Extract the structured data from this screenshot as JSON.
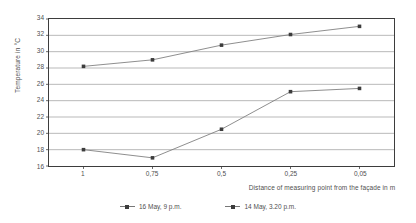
{
  "chart_data": {
    "type": "line",
    "title": "",
    "xlabel": "Distance of measuring point from the façade in m",
    "ylabel": "Temperature in °C",
    "categories": [
      "1",
      "0,75",
      "0,5",
      "0,25",
      "0,05"
    ],
    "ylim": [
      16,
      34
    ],
    "ytick_step": 2,
    "yticks": [
      "16",
      "18",
      "20",
      "22",
      "24",
      "26",
      "28",
      "30",
      "32",
      "34"
    ],
    "grid": "horizontal",
    "legend_position": "bottom",
    "series": [
      {
        "name": "16 May, 9 p.m.",
        "values": [
          18.0,
          17.0,
          20.5,
          25.1,
          25.5
        ],
        "color": "#808080",
        "marker_color": "#3c3c3c"
      },
      {
        "name": "14 May, 3.20 p.m.",
        "values": [
          28.2,
          29.0,
          30.8,
          32.1,
          33.1
        ],
        "color": "#808080",
        "marker_color": "#3c3c3c"
      }
    ]
  },
  "axes": {
    "y_title": "Temperature in °C",
    "x_title": "Distance of measuring point from the façade in m"
  },
  "legend": {
    "items": [
      {
        "label": "16 May, 9 p.m."
      },
      {
        "label": "14 May, 3.20 p.m."
      }
    ]
  },
  "colors": {
    "line": "#808080",
    "marker": "#3c3c3c",
    "grid": "#9a9a9a",
    "frame": "#3d3d3d",
    "text": "#4f4f4f",
    "background": "#ffffff"
  }
}
